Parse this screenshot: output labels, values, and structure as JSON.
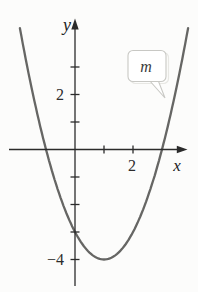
{
  "figure": {
    "background": "#fcfcfb",
    "axis_color": "#2b2b2b",
    "curve_color": "#666664",
    "labels": {
      "y_axis": "y",
      "x_axis": "x"
    },
    "callout": {
      "label": "m",
      "fill": "#ffffff",
      "border": "#c8c8c4"
    }
  },
  "chart_data": {
    "type": "line",
    "title": "",
    "curve_label": "m",
    "function": "y = x^2 - 2x - 3",
    "vertex": [
      1,
      -4
    ],
    "x_intercepts": [
      -1,
      3
    ],
    "y_intercept": -3,
    "x_range_drawn": [
      -1.9,
      3.9
    ],
    "xlabel": "x",
    "ylabel": "y",
    "x_axis_ticks": [
      1,
      2
    ],
    "y_axis_ticks": [
      -4,
      -3,
      -2,
      -1,
      1,
      2,
      3
    ],
    "x_labeled_ticks": [
      2
    ],
    "y_labeled_ticks": [
      2,
      -4
    ],
    "xlim": [
      -2.3,
      3.9
    ],
    "ylim": [
      -5,
      4.7
    ],
    "grid": false,
    "legend": "none",
    "points": [
      [
        -1.9,
        4.41
      ],
      [
        -1,
        0
      ],
      [
        0,
        -3
      ],
      [
        1,
        -4
      ],
      [
        2,
        -3
      ],
      [
        3,
        0
      ],
      [
        3.9,
        4.41
      ]
    ]
  }
}
